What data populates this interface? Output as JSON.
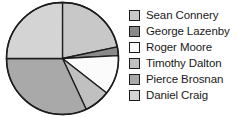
{
  "chart_data": {
    "type": "pie",
    "title": "",
    "subtitle": "",
    "xlabel": "",
    "ylabel": "",
    "grid": false,
    "legend_position": "right",
    "start_angle_deg": 0,
    "direction": "clockwise",
    "categories": [
      "Sean Connery",
      "George Lazenby",
      "Roger Moore",
      "Timothy Dalton",
      "Pierce Brosnan",
      "Daniel Craig"
    ],
    "values": [
      21.7,
      2.5,
      11.4,
      7.5,
      31.9,
      25.0
    ],
    "units": "percent",
    "slices": [
      {
        "label": "Sean Connery",
        "value": 21.7,
        "start_deg": 0.0,
        "end_deg": 78.0,
        "color": "#c8c8c8"
      },
      {
        "label": "George Lazenby",
        "value": 2.5,
        "start_deg": 78.0,
        "end_deg": 87.0,
        "color": "#8a8a8a"
      },
      {
        "label": "Roger Moore",
        "value": 11.4,
        "start_deg": 87.0,
        "end_deg": 128.0,
        "color": "#fbfbfb"
      },
      {
        "label": "Timothy Dalton",
        "value": 7.5,
        "start_deg": 128.0,
        "end_deg": 155.0,
        "color": "#c0c0c0"
      },
      {
        "label": "Pierce Brosnan",
        "value": 31.9,
        "start_deg": 155.0,
        "end_deg": 270.0,
        "color": "#a9a9a9"
      },
      {
        "label": "Daniel Craig",
        "value": 25.0,
        "start_deg": 270.0,
        "end_deg": 360.0,
        "color": "#d4d4d4"
      }
    ],
    "edge_color": "#1c1c1c",
    "background_color": "#ffffff"
  },
  "legend": {
    "items": [
      {
        "label": "Sean Connery",
        "color": "#c8c8c8"
      },
      {
        "label": "George Lazenby",
        "color": "#8a8a8a"
      },
      {
        "label": "Roger Moore",
        "color": "#fbfbfb"
      },
      {
        "label": "Timothy Dalton",
        "color": "#c0c0c0"
      },
      {
        "label": "Pierce Brosnan",
        "color": "#a9a9a9"
      },
      {
        "label": "Daniel Craig",
        "color": "#d4d4d4"
      }
    ]
  }
}
